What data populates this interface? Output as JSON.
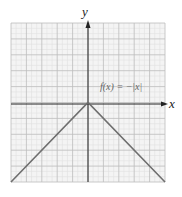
{
  "chart_data": {
    "type": "line",
    "title": "",
    "function_label": "f(x) = −|x|",
    "xlabel": "x",
    "ylabel": "y",
    "xlim": [
      -5,
      5
    ],
    "ylim": [
      -5,
      5
    ],
    "grid": true,
    "minor_grid_per_major": 3,
    "tick_labels": false,
    "series": [
      {
        "name": "f(x) = −|x|",
        "x": [
          -5,
          0,
          5
        ],
        "y": [
          -5,
          0,
          -5
        ],
        "color": "#666666"
      }
    ]
  },
  "labels": {
    "x": "x",
    "y": "y",
    "function": "f(x) = −|x|"
  },
  "colors": {
    "grid_major": "#bdbdbd",
    "grid_minor": "#e0e0e0",
    "background": "#f4f4f4",
    "axis": "#222222",
    "curve": "#6e6e6e"
  }
}
